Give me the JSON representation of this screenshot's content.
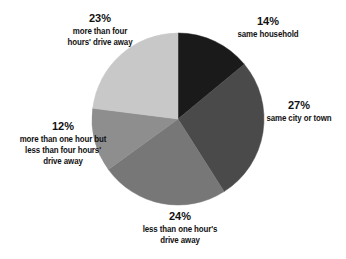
{
  "chart_data": {
    "type": "pie",
    "title": "",
    "subtitle": "",
    "xlabel": "",
    "ylabel": "",
    "legend_position": "none",
    "grid": false,
    "start_angle_deg": 0,
    "direction": "clockwise",
    "categories": [
      "same household",
      "same city or town",
      "less than one hour's drive away",
      "more than one hour but less than four hours' drive away",
      "more than four hours' drive away"
    ],
    "values": [
      14,
      27,
      24,
      12,
      23
    ],
    "value_labels": [
      "14%",
      "27%",
      "24%",
      "12%",
      "23%"
    ],
    "colors": [
      "#1a1a1a",
      "#4a4a4a",
      "#777777",
      "#8e8e8e",
      "#c8c8c8"
    ],
    "slices": [
      {
        "percent_label": "14%",
        "value": 14,
        "color": "#1a1a1a",
        "label_lines": [
          "same household"
        ]
      },
      {
        "percent_label": "27%",
        "value": 27,
        "color": "#4a4a4a",
        "label_lines": [
          "same city or town"
        ]
      },
      {
        "percent_label": "24%",
        "value": 24,
        "color": "#777777",
        "label_lines": [
          "less than one hour's",
          "drive away"
        ]
      },
      {
        "percent_label": "12%",
        "value": 12,
        "color": "#8e8e8e",
        "label_lines": [
          "more than one hour but",
          "less than four hours'",
          "drive away"
        ]
      },
      {
        "percent_label": "23%",
        "value": 23,
        "color": "#c8c8c8",
        "label_lines": [
          "more than four",
          "hours' drive away"
        ]
      }
    ]
  },
  "labels": {
    "same_household": {
      "pct": "14%",
      "line1": "same household"
    },
    "same_city": {
      "pct": "27%",
      "line1": "same city or town"
    },
    "less_one_hour": {
      "pct": "24%",
      "line1": "less than one hour's",
      "line2": "drive away"
    },
    "one_to_four": {
      "pct": "12%",
      "line1": "more than one hour but",
      "line2": "less than four hours'",
      "line3": "drive away"
    },
    "more_four_hours": {
      "pct": "23%",
      "line1": "more than four",
      "line2": "hours' drive away"
    }
  },
  "style": {
    "background": "#ffffff",
    "text_color": "#111111"
  }
}
